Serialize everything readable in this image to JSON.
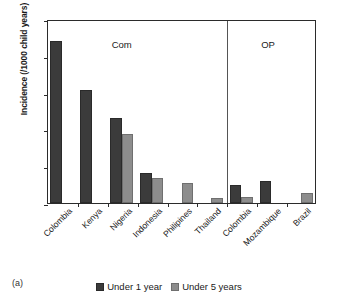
{
  "figure": {
    "panel_caption": "(a)"
  },
  "chart_data": {
    "type": "bar",
    "title": "",
    "xlabel": "",
    "ylabel": "Incidence (/1000 child years)",
    "ylim": [
      0,
      250
    ],
    "yticks": [
      0,
      50,
      100,
      150,
      200,
      250
    ],
    "grid": false,
    "legend_position": "bottom-center",
    "categories": [
      "Colombia",
      "Kenya",
      "Nigeria",
      "Indonesia",
      "Philipines",
      "Thailand",
      "Colombia",
      "Mozambique",
      "Brazil"
    ],
    "series": [
      {
        "name": "Under 1 year",
        "color": "#3b3b3b",
        "values": [
          220,
          153,
          115,
          41,
          null,
          null,
          24,
          30,
          null
        ]
      },
      {
        "name": "Under 5 years",
        "color": "#8d8d8d",
        "values": [
          null,
          null,
          94,
          34,
          27,
          7,
          8,
          null,
          13
        ]
      }
    ],
    "annotations": [
      {
        "text": "Com",
        "x_category_index": 2,
        "note": "group label for first six categories"
      },
      {
        "text": "OP",
        "x_category_index": 7,
        "note": "group label for last three categories"
      }
    ],
    "group_divider_after_category_index": 5
  }
}
